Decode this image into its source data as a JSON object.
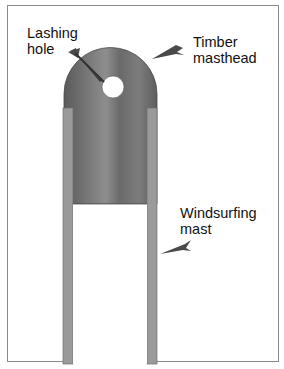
{
  "diagram": {
    "labels": {
      "lashing_hole": "Lashing\nhole",
      "timber_masthead": "Timber\nmasthead",
      "windsurfing_mast": "Windsurfing\nmast"
    },
    "colors": {
      "timber_dark": "#5e5e5e",
      "timber_light": "#8c8c8c",
      "mast_tube": "#9a9a9a",
      "arrow": "#4a4a4a",
      "frame": "#8a8a8a"
    }
  }
}
